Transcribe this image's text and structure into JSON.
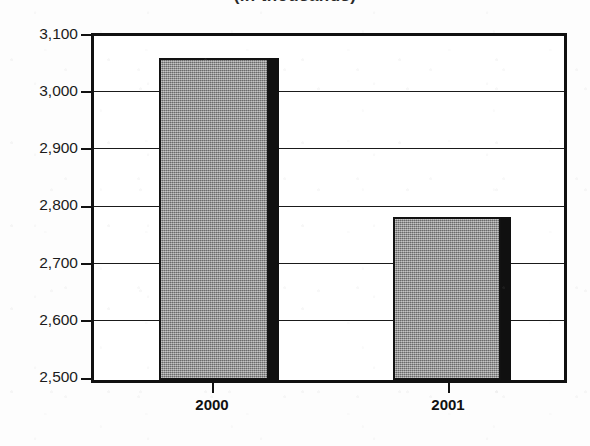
{
  "chart_data": {
    "type": "bar",
    "title": "(in thousands)",
    "title_clipped": true,
    "xlabel": "",
    "ylabel": "",
    "categories": [
      "2000",
      "2001"
    ],
    "values": [
      3062,
      2785
    ],
    "ylim": [
      2500,
      3100
    ],
    "ytick_labels": [
      "3,100",
      "3,000",
      "2,900",
      "2,800",
      "2,700",
      "2,600",
      "2,500"
    ],
    "ytick_values": [
      3100,
      3000,
      2900,
      2800,
      2700,
      2600,
      2500
    ],
    "grid": true,
    "legend": "none",
    "series": [
      {
        "name": "value",
        "values": [
          3062,
          2785
        ]
      }
    ],
    "bar_fill_color": "#8d8d8d",
    "bar_edge_color": "#121212",
    "bar_shadow_color": "#101010",
    "axis_color": "#111111",
    "background_color": "#ffffff"
  },
  "axis": {
    "y_labels": [
      {
        "text": "3,100",
        "value": 3100
      },
      {
        "text": "3,000",
        "value": 3000
      },
      {
        "text": "2,900",
        "value": 2900
      },
      {
        "text": "2,800",
        "value": 2800
      },
      {
        "text": "2,700",
        "value": 2700
      },
      {
        "text": "2,600",
        "value": 2600
      },
      {
        "text": "2,500",
        "value": 2500
      }
    ],
    "x_labels": [
      {
        "text": "2000"
      },
      {
        "text": "2001"
      }
    ]
  }
}
